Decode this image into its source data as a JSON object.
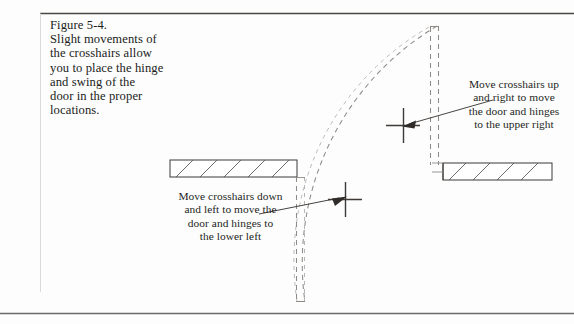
{
  "figure": {
    "caption_lines": [
      "Figure 5-4.",
      "Slight movements of",
      "the crosshairs allow",
      "you to place the hinge",
      "and swing of the",
      "door in the proper",
      "locations."
    ]
  },
  "annotations": {
    "upper_right": {
      "lines": [
        "Move crosshairs up",
        "and right to move",
        "the door and hinges",
        "to the upper right"
      ]
    },
    "lower_left": {
      "lines": [
        "Move crosshairs down",
        "and left to move the",
        "door and hinges to",
        "the lower left"
      ]
    }
  },
  "drawing": {
    "line_color": "#3d3a37",
    "dashed_color": "#8d8a87",
    "rule_color": "#4a4745",
    "wall_fill": "#ffffff",
    "crosshair_upper": {
      "x": 403,
      "y": 125
    },
    "crosshair_lower": {
      "x": 345,
      "y": 199
    }
  }
}
